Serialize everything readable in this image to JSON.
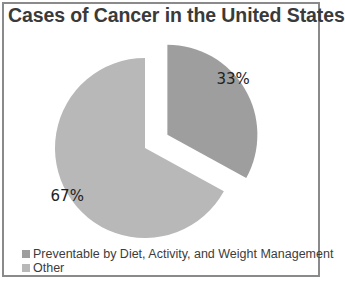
{
  "chart_data": {
    "type": "pie",
    "title": "Cases of Cancer in the United States",
    "categories": [
      "Preventable by Diet, Activity, and Weight Management",
      "Other"
    ],
    "values": [
      33,
      67
    ],
    "labels": [
      "33%",
      "67%"
    ],
    "colors": [
      "#9e9e9e",
      "#b8b8b8"
    ],
    "exploded": [
      "Preventable by Diet, Activity, and Weight Management"
    ],
    "legend_position": "bottom-left"
  }
}
